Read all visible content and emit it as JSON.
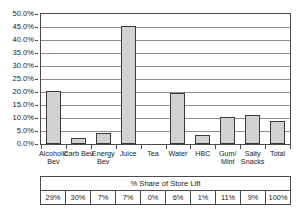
{
  "chart_data": {
    "type": "bar",
    "title": "",
    "xlabel": "",
    "ylabel": "",
    "ylim": [
      0,
      50
    ],
    "ytick_labels": [
      "50.0%",
      "45.0%",
      "40.0%",
      "35.0%",
      "30.0%",
      "25.0%",
      "20.0%",
      "15.0%",
      "10.0%",
      "5.0%",
      "0.0%"
    ],
    "ytick_values": [
      50,
      45,
      40,
      35,
      30,
      25,
      20,
      15,
      10,
      5,
      0
    ],
    "grid": true,
    "legend": "none",
    "categories": [
      "Alcoholic\nBev",
      "Carb Bev",
      "Energy\nBev",
      "Juice",
      "Tea",
      "Water",
      "HBC",
      "Gum/\nMint",
      "Salty\nSnacks",
      "Total"
    ],
    "values": [
      20.2,
      2.4,
      4.4,
      45.3,
      0.0,
      19.5,
      3.4,
      10.2,
      11.0,
      8.8
    ],
    "bar_fill_color": "#d2d2d2",
    "bar_border_color": "#3a3a3a"
  },
  "table": {
    "header": "% Share of Store Lift",
    "cells": [
      "29%",
      "30%",
      "7%",
      "7%",
      "0%",
      "6%",
      "1%",
      "11%",
      "9%",
      "100%"
    ]
  },
  "title_sliver": {
    "text": "· ·  ·  · ·   ·  ·"
  }
}
